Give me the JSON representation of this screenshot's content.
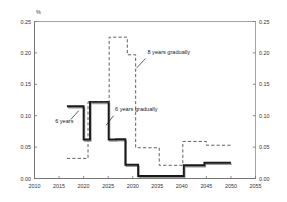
{
  "chart_data": {
    "type": "line",
    "title": "",
    "subtitle": "",
    "unit_label": "%",
    "xlabel": "",
    "ylabel": "",
    "xlim": [
      2010,
      2055
    ],
    "ylim": [
      0.0,
      0.25
    ],
    "y2lim": [
      0.0,
      0.25
    ],
    "grid": false,
    "legend_position": "inline-annotations",
    "xticks": [
      "2010",
      "2015",
      "2020",
      "2025",
      "2030",
      "2035",
      "2040",
      "2045",
      "2050",
      "2055"
    ],
    "xtick_values": [
      2010,
      2015,
      2020,
      2025,
      2030,
      2035,
      2040,
      2045,
      2050,
      2055
    ],
    "yticks": [
      "0.00",
      "0.05",
      "0.10",
      "0.15",
      "0.20",
      "0.25"
    ],
    "ytick_values": [
      0.0,
      0.05,
      0.1,
      0.15,
      0.2,
      0.25
    ],
    "y2ticks": [
      "0.00",
      "0.05",
      "0.10",
      "0.15",
      "0.20",
      "0.25"
    ],
    "y2tick_values": [
      0.0,
      0.05,
      0.1,
      0.15,
      0.2,
      0.25
    ],
    "annotations": [
      {
        "id": "annot-six-years",
        "text": "6 years",
        "text_x": 2014.2,
        "text_y": 0.088,
        "leader_from": [
          2017.4,
          0.094
        ],
        "leader_to": [
          2019.0,
          0.108
        ]
      },
      {
        "id": "annot-six-years-gradually",
        "text": "6 years gradually",
        "text_x": 2026.4,
        "text_y": 0.107,
        "leader_from": [
          2026.1,
          0.1
        ],
        "leader_to": [
          2024.6,
          0.085
        ]
      },
      {
        "id": "annot-eight-years-gradually",
        "text": "8 years gradually",
        "text_x": 2033.0,
        "text_y": 0.198,
        "leader_from": [
          2032.6,
          0.191
        ],
        "leader_to": [
          2030.8,
          0.176
        ]
      }
    ],
    "series": [
      {
        "name": "6 years",
        "style": "solid",
        "color": "#1a1a1a",
        "step": true,
        "points": [
          [
            2016.6,
            0.115
          ],
          [
            2020.0,
            0.115
          ],
          [
            2020.0,
            0.062
          ],
          [
            2021.3,
            0.062
          ],
          [
            2021.3,
            0.122
          ],
          [
            2025.1,
            0.122
          ],
          [
            2025.1,
            0.062
          ],
          [
            2026.6,
            0.062
          ],
          [
            2026.6,
            0.0625
          ],
          [
            2028.5,
            0.0625
          ],
          [
            2028.5,
            0.022
          ],
          [
            2031.1,
            0.022
          ],
          [
            2031.1,
            0.004
          ],
          [
            2040.4,
            0.004
          ],
          [
            2040.4,
            0.021
          ],
          [
            2044.6,
            0.021
          ],
          [
            2044.6,
            0.025
          ],
          [
            2050.0,
            0.025
          ]
        ]
      },
      {
        "name": "6 years gradually",
        "style": "dashed",
        "color": "#444444",
        "step": true,
        "points": [
          [
            2016.6,
            0.032
          ],
          [
            2020.9,
            0.032
          ],
          [
            2020.9,
            0.122
          ],
          [
            2025.2,
            0.122
          ],
          [
            2025.2,
            0.225
          ],
          [
            2028.9,
            0.225
          ],
          [
            2028.9,
            0.197
          ],
          [
            2030.6,
            0.197
          ],
          [
            2030.6,
            0.049
          ],
          [
            2035.4,
            0.049
          ],
          [
            2035.4,
            0.021
          ],
          [
            2040.2,
            0.021
          ],
          [
            2040.2,
            0.059
          ],
          [
            2045.0,
            0.059
          ],
          [
            2045.0,
            0.053
          ],
          [
            2050.0,
            0.053
          ]
        ]
      }
    ]
  }
}
